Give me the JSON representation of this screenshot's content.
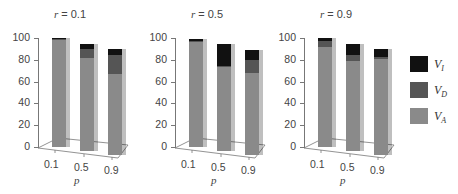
{
  "colors": {
    "VI": "#111111",
    "VD": "#555555",
    "VA": "#8a8a8a",
    "axis": "#777777"
  },
  "legend": [
    {
      "label": "V",
      "sub": "I",
      "key": "VI"
    },
    {
      "label": "V",
      "sub": "D",
      "key": "VD"
    },
    {
      "label": "V",
      "sub": "A",
      "key": "VA"
    }
  ],
  "panels": [
    {
      "title_var": "r",
      "title_val": " = 0.1"
    },
    {
      "title_var": "r",
      "title_val": " = 0.5"
    },
    {
      "title_var": "r",
      "title_val": " = 0.9"
    }
  ],
  "xlabel": "p",
  "yticks": [
    "0",
    "20",
    "40",
    "60",
    "80",
    "100"
  ],
  "xticks": [
    "0.1",
    "0.5",
    "0.9"
  ],
  "chart_data": {
    "type": "bar",
    "stacked": true,
    "title": "",
    "xlabel": "p",
    "ylabel": "",
    "ylim": [
      0,
      100
    ],
    "grid": false,
    "legend_position": "right",
    "legend": [
      "V_I",
      "V_D",
      "V_A"
    ],
    "facets": [
      {
        "title": "r = 0.1",
        "categories": [
          "0.1",
          "0.5",
          "0.9"
        ],
        "series": [
          {
            "name": "V_A",
            "values": [
              98,
              85,
              74
            ]
          },
          {
            "name": "V_D",
            "values": [
              1,
              9,
              18
            ]
          },
          {
            "name": "V_I",
            "values": [
              1,
              4,
              5
            ]
          }
        ]
      },
      {
        "title": "r = 0.5",
        "categories": [
          "0.1",
          "0.5",
          "0.9"
        ],
        "series": [
          {
            "name": "V_A",
            "values": [
              96,
              77,
              75
            ]
          },
          {
            "name": "V_D",
            "values": [
              1,
              1,
              12
            ]
          },
          {
            "name": "V_I",
            "values": [
              2,
              20,
              9
            ]
          }
        ]
      },
      {
        "title": "r = 0.9",
        "categories": [
          "0.1",
          "0.5",
          "0.9"
        ],
        "series": [
          {
            "name": "V_A",
            "values": [
              92,
              83,
              88
            ]
          },
          {
            "name": "V_D",
            "values": [
              5,
              5,
              2
            ]
          },
          {
            "name": "V_I",
            "values": [
              3,
              10,
              7
            ]
          }
        ]
      }
    ]
  }
}
